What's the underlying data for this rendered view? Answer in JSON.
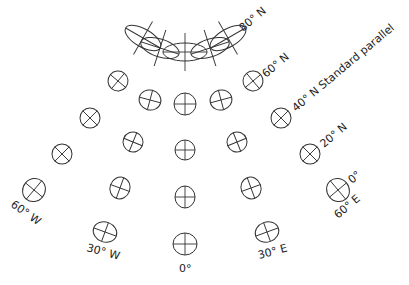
{
  "diagram": {
    "type": "Tissot indicatrix map projection diagram",
    "labels": {
      "lat80": "80° N",
      "lat60": "60° N",
      "lat40": "40° N Standard parallel",
      "lat20": "20° N",
      "lat0": "0°",
      "lon60w": "60° W",
      "lon30w": "30° W",
      "lon0": "0°",
      "lon30e": "30° E",
      "lon60e": "60° E"
    },
    "indicatrices": [
      {
        "row": "80N",
        "cx": 143,
        "cy": 38,
        "rx": 20,
        "ry": 9,
        "rot": 30
      },
      {
        "row": "80N",
        "cx": 160,
        "cy": 48,
        "rx": 20,
        "ry": 9,
        "rot": 18
      },
      {
        "row": "80N",
        "cx": 185,
        "cy": 52,
        "rx": 22,
        "ry": 9,
        "rot": 0
      },
      {
        "row": "80N",
        "cx": 210,
        "cy": 48,
        "rx": 20,
        "ry": 9,
        "rot": -18
      },
      {
        "row": "80N",
        "cx": 228,
        "cy": 38,
        "rx": 20,
        "ry": 9,
        "rot": -30
      },
      {
        "row": "60N",
        "cx": 118,
        "cy": 81,
        "rx": 10,
        "ry": 10,
        "rot": 40
      },
      {
        "row": "60N",
        "cx": 150,
        "cy": 100,
        "rx": 11,
        "ry": 10,
        "rot": 15
      },
      {
        "row": "60N",
        "cx": 185,
        "cy": 104,
        "rx": 11,
        "ry": 11,
        "rot": 0
      },
      {
        "row": "60N",
        "cx": 221,
        "cy": 100,
        "rx": 11,
        "ry": 10,
        "rot": -15
      },
      {
        "row": "60N",
        "cx": 253,
        "cy": 81,
        "rx": 10,
        "ry": 10,
        "rot": -40
      },
      {
        "row": "40N",
        "cx": 90,
        "cy": 118,
        "rx": 10,
        "ry": 10,
        "rot": 45
      },
      {
        "row": "40N",
        "cx": 133,
        "cy": 142,
        "rx": 10,
        "ry": 10,
        "rot": 22
      },
      {
        "row": "40N",
        "cx": 185,
        "cy": 150,
        "rx": 10,
        "ry": 10,
        "rot": 0
      },
      {
        "row": "40N",
        "cx": 237,
        "cy": 142,
        "rx": 10,
        "ry": 10,
        "rot": -22
      },
      {
        "row": "40N",
        "cx": 281,
        "cy": 118,
        "rx": 10,
        "ry": 10,
        "rot": -45
      },
      {
        "row": "20N",
        "cx": 62,
        "cy": 154,
        "rx": 10,
        "ry": 10,
        "rot": 45
      },
      {
        "row": "20N",
        "cx": 120,
        "cy": 188,
        "rx": 10,
        "ry": 11,
        "rot": 20
      },
      {
        "row": "20N",
        "cx": 185,
        "cy": 197,
        "rx": 10,
        "ry": 11,
        "rot": 0
      },
      {
        "row": "20N",
        "cx": 251,
        "cy": 188,
        "rx": 10,
        "ry": 11,
        "rot": -20
      },
      {
        "row": "20N",
        "cx": 310,
        "cy": 154,
        "rx": 10,
        "ry": 10,
        "rot": -45
      },
      {
        "row": "0",
        "cx": 34,
        "cy": 190,
        "rx": 11,
        "ry": 12,
        "rot": 40
      },
      {
        "row": "0",
        "cx": 105,
        "cy": 232,
        "rx": 12,
        "ry": 10,
        "rot": 20
      },
      {
        "row": "0",
        "cx": 185,
        "cy": 244,
        "rx": 12,
        "ry": 11,
        "rot": 0
      },
      {
        "row": "0",
        "cx": 267,
        "cy": 232,
        "rx": 12,
        "ry": 10,
        "rot": -20
      },
      {
        "row": "0",
        "cx": 338,
        "cy": 190,
        "rx": 11,
        "ry": 12,
        "rot": -40
      }
    ]
  }
}
